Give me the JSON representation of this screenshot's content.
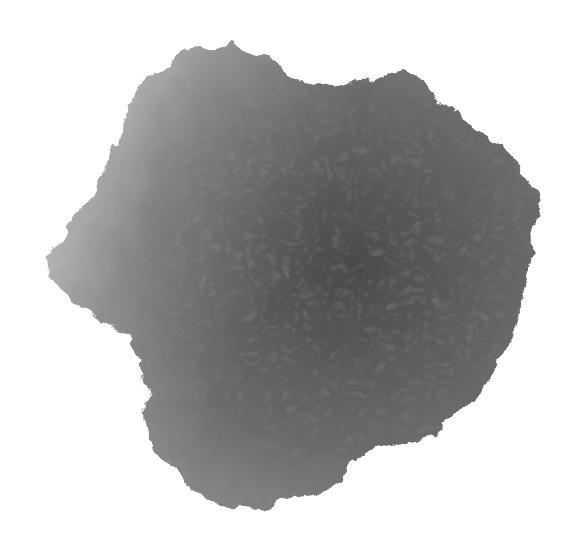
{
  "image": {
    "subject": "grayscale watercolor ink blot texture",
    "background_color": "#ffffff",
    "colors": {
      "light_edge": "#c8c8c8",
      "mid_tone": "#7a7a7a",
      "dark_core": "#4a4a4a"
    }
  }
}
